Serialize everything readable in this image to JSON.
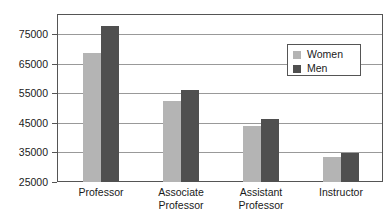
{
  "chart_data": {
    "type": "bar",
    "title": "",
    "subtitle": "",
    "xlabel": "",
    "ylabel": "",
    "categories": [
      "Professor",
      "Associate Professor",
      "Assistant Professor",
      "Instructor"
    ],
    "category_lines": [
      [
        "Professor"
      ],
      [
        "Associate",
        "Professor"
      ],
      [
        "Assistant",
        "Professor"
      ],
      [
        "Instructor"
      ]
    ],
    "series": [
      {
        "name": "Women",
        "color": "#b4b4b4",
        "values": [
          68500,
          52500,
          44000,
          33400
        ]
      },
      {
        "name": "Men",
        "color": "#4f4f4f",
        "values": [
          77700,
          56000,
          46200,
          34800
        ]
      }
    ],
    "ylim": [
      25000,
      81700
    ],
    "yticks": [
      25000,
      35000,
      45000,
      55000,
      65000,
      75000
    ],
    "ytick_labels": [
      "25000",
      "35000",
      "45000",
      "55000",
      "65000",
      "75000"
    ],
    "grid": true,
    "grid_axis": "y",
    "legend_position": "top-right",
    "legend": [
      "Women",
      "Men"
    ],
    "annotations": []
  },
  "legend": {
    "women_label": "Women",
    "men_label": "Men"
  },
  "axis": {
    "y_labels": [
      "75000",
      "65000",
      "55000",
      "45000",
      "35000",
      "25000"
    ]
  },
  "x_axis": {
    "labels": [
      {
        "line1": "Professor",
        "line2": ""
      },
      {
        "line1": "Associate",
        "line2": "Professor"
      },
      {
        "line1": "Assistant",
        "line2": "Professor"
      },
      {
        "line1": "Instructor",
        "line2": ""
      }
    ]
  },
  "colors": {
    "women": "#b4b4b4",
    "men": "#4f4f4f",
    "grid": "#999999",
    "frame": "#555555",
    "text": "#1a1a1a",
    "background": "#ffffff"
  }
}
